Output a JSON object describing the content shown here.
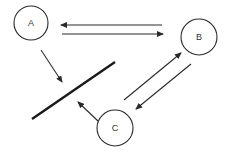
{
  "diagram": {
    "nodes": [
      {
        "id": "A",
        "label": "A",
        "cx": 31,
        "cy": 23,
        "r": 17
      },
      {
        "id": "B",
        "label": "B",
        "cx": 199,
        "cy": 37,
        "r": 18
      },
      {
        "id": "C",
        "label": "C",
        "cx": 115,
        "cy": 128,
        "r": 18
      }
    ],
    "edges": [
      {
        "from": "B",
        "to": "A",
        "x1": 162,
        "y1": 25,
        "x2": 61,
        "y2": 25
      },
      {
        "from": "A",
        "to": "B",
        "x1": 62,
        "y1": 34,
        "x2": 163,
        "y2": 34
      },
      {
        "from": "A",
        "to": "barrier",
        "x1": 41,
        "y1": 50,
        "x2": 62,
        "y2": 82
      },
      {
        "from": "C",
        "to": "barrier",
        "x1": 98,
        "y1": 121,
        "x2": 78,
        "y2": 102
      },
      {
        "from": "C",
        "to": "B",
        "x1": 124,
        "y1": 100,
        "x2": 181,
        "y2": 53
      },
      {
        "from": "B",
        "to": "C",
        "x1": 191,
        "y1": 64,
        "x2": 136,
        "y2": 109
      }
    ],
    "barrier": {
      "x1": 32,
      "y1": 119,
      "x2": 115,
      "y2": 62
    },
    "colors": {
      "stroke": "#2a2a2a",
      "text": "#333333",
      "background": "#ffffff"
    }
  }
}
